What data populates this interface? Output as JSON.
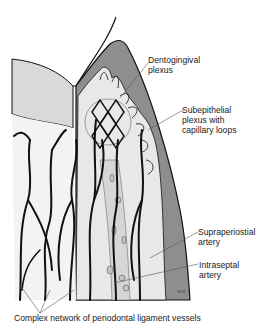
{
  "figure": {
    "type": "anatomical-illustration",
    "colors": {
      "background": "#ffffff",
      "gingiva_dark": "#8c8c8c",
      "tooth": "#d4d4d4",
      "tissue_light": "#e6e6e6",
      "vessel": "#111111"
    }
  },
  "labels": {
    "dentogingival": {
      "line1": "Dentogingival",
      "line2": "plexus"
    },
    "subepithelial": {
      "line1": "Subepithelial",
      "line2": "plexus with",
      "line3": "capillary loops"
    },
    "supraperiostial": {
      "line1": "Supraperiostial",
      "line2": "artery"
    },
    "intraseptal": {
      "line1": "Intraseptal",
      "line2": "artery"
    },
    "pdl": {
      "line1": "Complex network of periodontal ligament vessels"
    }
  },
  "credit": "ECW"
}
